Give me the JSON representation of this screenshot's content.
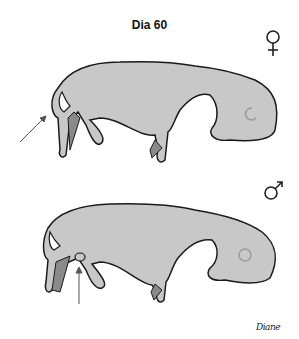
{
  "figure": {
    "title": "Dia 60",
    "panels": [
      {
        "label": "female",
        "symbol": "♀",
        "annotation": "arrow pointing to genital region (vulva)"
      },
      {
        "label": "male",
        "symbol": "♂",
        "annotation": "arrow pointing to genital region (scrotum/penis)"
      }
    ],
    "signature": "Diane",
    "colors": {
      "body": "#c8c8c8",
      "outline": "#1a1a1a",
      "limb_dark": "#8a8a8a",
      "arrow": "#555555"
    }
  }
}
